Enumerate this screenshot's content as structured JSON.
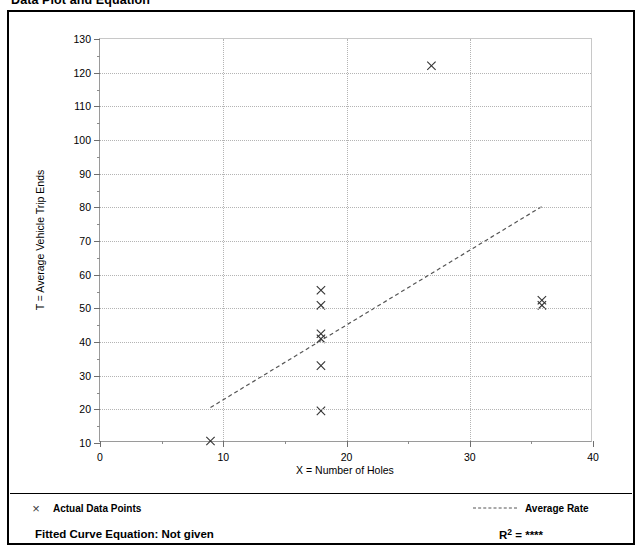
{
  "page": {
    "title": "Data Plot and Equation"
  },
  "legend": {
    "points_marker": "×",
    "points_label": "Actual Data Points",
    "rate_label": "Average Rate"
  },
  "footer": {
    "equation_label": "Fitted Curve Equation:  Not given",
    "r2_prefix": "R",
    "r2_exponent": "2",
    "r2_value": " = ****"
  },
  "chart_data": {
    "type": "scatter",
    "title": "Data Plot and Equation",
    "xlabel": "X = Number of Holes",
    "ylabel": "T = Average Vehicle Trip Ends",
    "xlim": [
      0,
      40
    ],
    "ylim": [
      10,
      130
    ],
    "xticks": [
      0,
      10,
      20,
      30,
      40
    ],
    "xticks_minor": [
      5,
      15,
      25,
      35
    ],
    "yticks": [
      10,
      20,
      30,
      40,
      50,
      60,
      70,
      80,
      90,
      100,
      110,
      120,
      130
    ],
    "yticks_minor": [
      15,
      25,
      35,
      45,
      55,
      65,
      75,
      85,
      95,
      105,
      115,
      125
    ],
    "grid": true,
    "legend_position": "below-plot",
    "series": [
      {
        "name": "Actual Data Points",
        "type": "scatter",
        "marker": "x",
        "color": "#333333",
        "points": [
          {
            "x": 9,
            "y": 10
          },
          {
            "x": 18,
            "y": 19
          },
          {
            "x": 18,
            "y": 32.5
          },
          {
            "x": 18,
            "y": 40.5
          },
          {
            "x": 18,
            "y": 42
          },
          {
            "x": 18,
            "y": 50.5
          },
          {
            "x": 18,
            "y": 55
          },
          {
            "x": 27,
            "y": 122
          },
          {
            "x": 36,
            "y": 50.5
          },
          {
            "x": 36,
            "y": 52
          }
        ]
      },
      {
        "name": "Average Rate",
        "type": "line",
        "style": "dashed",
        "color": "#555555",
        "points": [
          {
            "x": 9,
            "y": 20
          },
          {
            "x": 36,
            "y": 80
          }
        ]
      }
    ]
  }
}
